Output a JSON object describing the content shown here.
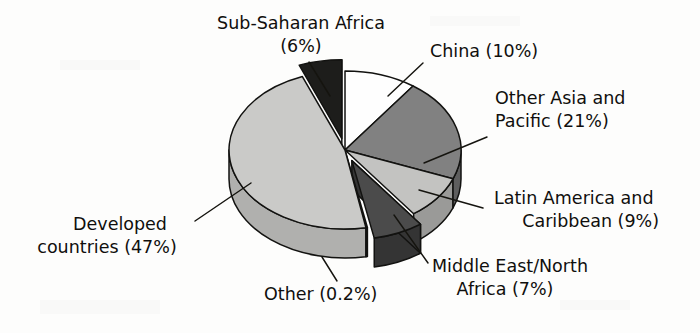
{
  "figure": {
    "title": "",
    "background_color": "#fdfdfc",
    "text_color": "#100f0d",
    "line_color": "#15140f"
  },
  "chart_data": {
    "type": "pie",
    "title": "",
    "subtitle": "",
    "xlabel": "",
    "ylabel": "",
    "style": "3d-exploded-pie",
    "grid": false,
    "legend": "none",
    "label_format": "{name} ({value}%)",
    "total_percent": 100,
    "categories": [
      "China",
      "Other Asia and Pacific",
      "Latin America and Caribbean",
      "Middle East/North Africa",
      "Other",
      "Developed countries",
      "Sub-Saharan Africa"
    ],
    "values": [
      10,
      21,
      9,
      7,
      0.2,
      47,
      6
    ],
    "slices": [
      {
        "name": "China",
        "value": 10,
        "value_text": "10%",
        "label": "China (10%)",
        "color": "#fefefe",
        "side_color": "#e2e2e0",
        "exploded": false
      },
      {
        "name": "Other Asia and Pacific",
        "value": 21,
        "value_text": "21%",
        "label_line1": "Other Asia and",
        "label_line2": "Pacific (21%)",
        "label": "Other Asia and Pacific (21%)",
        "color": "#818181",
        "side_color": "#5e5e5e",
        "exploded": false
      },
      {
        "name": "Latin America and Caribbean",
        "value": 9,
        "value_text": "9%",
        "label_line1": "Latin America and",
        "label_line2": "Caribbean (9%)",
        "label": "Latin America and Caribbean (9%)",
        "color": "#c3c3c1",
        "side_color": "#9a9a98",
        "exploded": false
      },
      {
        "name": "Middle East/North Africa",
        "value": 7,
        "value_text": "7%",
        "label_line1": "Middle East/North",
        "label_line2": "Africa (7%)",
        "label": "Middle East/North Africa (7%)",
        "color": "#4b4b4b",
        "side_color": "#343434",
        "exploded": true
      },
      {
        "name": "Other",
        "value": 0.2,
        "value_text": "0.2%",
        "label": "Other (0.2%)",
        "color": "#fdfdfc",
        "side_color": "#e6e6e4",
        "exploded": false
      },
      {
        "name": "Developed countries",
        "value": 47,
        "value_text": "47%",
        "label_line1": "Developed",
        "label_line2": "countries (47%)",
        "label": "Developed countries (47%)",
        "color": "#cacac8",
        "side_color": "#b0b0ae",
        "exploded": false
      },
      {
        "name": "Sub-Saharan Africa",
        "value": 6,
        "value_text": "6%",
        "label_line1": "Sub-Saharan Africa",
        "label_line2": "(6%)",
        "label": "Sub-Saharan Africa (6%)",
        "color": "#1d1d1b",
        "side_color": "#101010",
        "exploded": true
      }
    ]
  }
}
